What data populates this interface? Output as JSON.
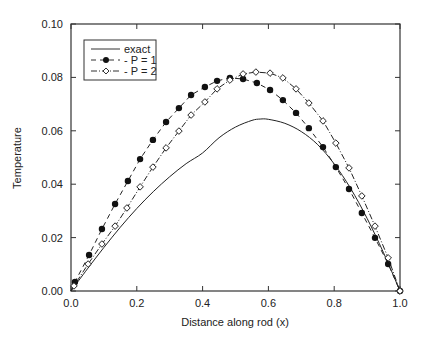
{
  "chart_data": {
    "type": "line",
    "title": "",
    "xlabel": "Distance along rod (x)",
    "ylabel": "Temperature",
    "xlim": [
      0,
      1.0
    ],
    "ylim": [
      0,
      0.1
    ],
    "xticks": [
      "0.0",
      "0.2",
      "0.4",
      "0.6",
      "0.8",
      "1.0"
    ],
    "yticks": [
      "0.00",
      "0.02",
      "0.04",
      "0.06",
      "0.08",
      "0.10"
    ],
    "grid": false,
    "legend_position": "upper left",
    "series": [
      {
        "name": "exact",
        "style": "solid line",
        "x": [
          0.0,
          0.05,
          0.1,
          0.15,
          0.2,
          0.25,
          0.3,
          0.35,
          0.4,
          0.45,
          0.5,
          0.55,
          0.575,
          0.6,
          0.65,
          0.7,
          0.75,
          0.8,
          0.85,
          0.9,
          0.95,
          1.0
        ],
        "y": [
          0.0,
          0.0083,
          0.0163,
          0.0239,
          0.0309,
          0.0372,
          0.0428,
          0.0477,
          0.0517,
          0.0574,
          0.0614,
          0.0639,
          0.0644,
          0.0643,
          0.0628,
          0.0597,
          0.0548,
          0.0476,
          0.0384,
          0.0272,
          0.0143,
          0.0
        ]
      },
      {
        "name": "P = 1",
        "style": "dashed line, filled circle markers",
        "x": [
          0.012,
          0.055,
          0.094,
          0.134,
          0.173,
          0.21,
          0.249,
          0.289,
          0.328,
          0.365,
          0.407,
          0.444,
          0.483,
          0.523,
          0.565,
          0.605,
          0.644,
          0.684,
          0.723,
          0.766,
          0.805,
          0.845,
          0.884,
          0.924,
          0.964,
          1.0
        ],
        "y": [
          0.0034,
          0.0135,
          0.0232,
          0.0326,
          0.0412,
          0.0494,
          0.0566,
          0.0633,
          0.0685,
          0.0734,
          0.0764,
          0.0787,
          0.0798,
          0.0794,
          0.0779,
          0.0753,
          0.0715,
          0.0667,
          0.061,
          0.0539,
          0.0464,
          0.0382,
          0.0292,
          0.0199,
          0.0101,
          0.0
        ]
      },
      {
        "name": "P = 2",
        "style": "dash-dot line, open diamond markers",
        "x": [
          0.009,
          0.052,
          0.094,
          0.134,
          0.17,
          0.21,
          0.249,
          0.289,
          0.328,
          0.365,
          0.407,
          0.444,
          0.483,
          0.523,
          0.562,
          0.605,
          0.644,
          0.684,
          0.723,
          0.766,
          0.805,
          0.845,
          0.884,
          0.924,
          0.964,
          1.0
        ],
        "y": [
          0.0019,
          0.0101,
          0.0176,
          0.0243,
          0.0311,
          0.039,
          0.0464,
          0.0536,
          0.0599,
          0.0659,
          0.0708,
          0.0757,
          0.079,
          0.0813,
          0.082,
          0.0816,
          0.0798,
          0.0757,
          0.0704,
          0.0637,
          0.0554,
          0.0461,
          0.0356,
          0.0243,
          0.0124,
          0.0
        ]
      }
    ]
  },
  "legend": {
    "items": [
      "exact",
      "- P = 1",
      "- P = 2"
    ]
  }
}
